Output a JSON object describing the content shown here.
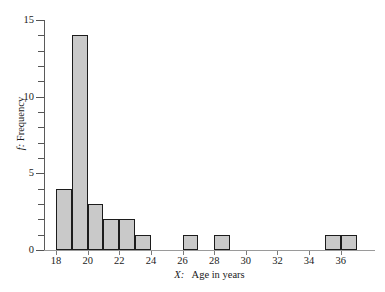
{
  "chart_data": {
    "type": "bar",
    "title": "",
    "subtitle": "",
    "xlabel_italic": "X:",
    "xlabel_rest": "   Age in years",
    "xlabel": "X:   Age in years",
    "ylabel_italic": "f:",
    "ylabel_rest": " Frequency",
    "ylabel": "f: Frequency",
    "grid": false,
    "legend": false,
    "bin_width": 1,
    "xlim": [
      17,
      38
    ],
    "ylim": [
      0,
      15
    ],
    "x_major_ticks": [
      18,
      20,
      22,
      24,
      26,
      28,
      30,
      32,
      34,
      36
    ],
    "x_tick_labels": [
      "18",
      "20",
      "22",
      "24",
      "26",
      "28",
      "30",
      "32",
      "34",
      "36"
    ],
    "y_major_ticks": [
      0,
      5,
      10,
      15
    ],
    "y_tick_labels": [
      "0",
      "5",
      "10",
      "15"
    ],
    "y_minor_ticks": [
      1,
      2,
      3,
      4,
      6,
      7,
      8,
      9,
      11,
      12,
      13,
      14
    ],
    "bin_starts": [
      18,
      19,
      20,
      21,
      22,
      23,
      26,
      28,
      35,
      36
    ],
    "categories": [
      "18-19",
      "19-20",
      "20-21",
      "21-22",
      "22-23",
      "23-24",
      "26-27",
      "28-29",
      "35-36",
      "36-37"
    ],
    "values": [
      4,
      14,
      3,
      2,
      2,
      1,
      1,
      1,
      1,
      1
    ],
    "bar_fill_color": "#c9c9c9",
    "bar_edge_color": "#1c1c1c",
    "axis_color": "#5a5a5a",
    "background_color": "#ffffff"
  }
}
